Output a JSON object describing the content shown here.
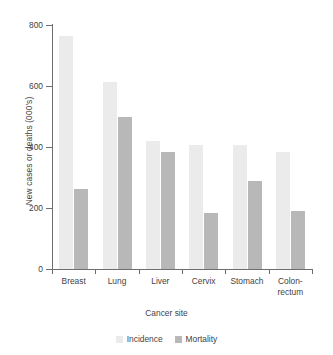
{
  "chart_data": {
    "type": "bar",
    "title": "",
    "xlabel": "Cancer site",
    "ylabel": "New cases or deaths (000's)",
    "categories": [
      "Breast",
      "Lung",
      "Liver",
      "Cervix",
      "Stomach",
      "Colon-\nrectum"
    ],
    "series": [
      {
        "name": "Incidence",
        "color": "#ebebeb",
        "values": [
          765,
          612,
          420,
          405,
          405,
          383
        ]
      },
      {
        "name": "Mortality",
        "color": "#b8b8b8",
        "values": [
          262,
          498,
          385,
          185,
          288,
          191
        ]
      }
    ],
    "ylim": [
      0,
      800
    ],
    "yticks": [
      0,
      200,
      400,
      600,
      800
    ],
    "ytick_labels": [
      "0",
      "200",
      "400",
      "600",
      "800"
    ],
    "grid": false,
    "legend_position": "bottom"
  },
  "axes": {
    "y_title": "New cases or deaths (000's)",
    "x_title": "Cancer site",
    "y_tick_labels": [
      "800",
      "600",
      "400",
      "200",
      "0"
    ]
  },
  "legend": {
    "items": [
      {
        "label": "Incidence",
        "color": "#ebebeb"
      },
      {
        "label": "Mortality",
        "color": "#b8b8b8"
      }
    ]
  }
}
